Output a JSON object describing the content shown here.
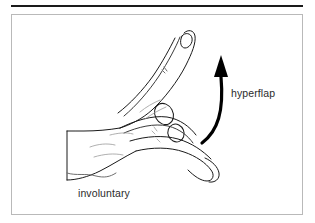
{
  "figure": {
    "kind": "line-art-illustration",
    "background_color": "#ffffff",
    "rule_color": "#1a1a1a",
    "border_color": "#b9b9b9",
    "ink_color": "#1a1a1a",
    "light_ink_color": "#8a8a8a",
    "labels": {
      "hyperflap": "hyperflap",
      "involuntary": "involuntary"
    },
    "annotations": {
      "arrow": "curved-arrow-upward",
      "arrow_color": "#000000"
    }
  }
}
